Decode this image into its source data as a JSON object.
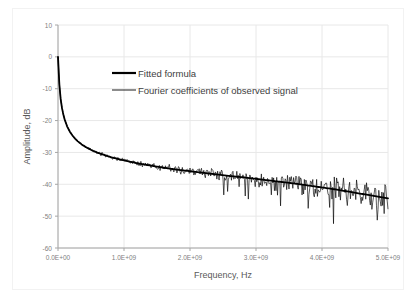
{
  "chart_data": {
    "type": "line",
    "title": "",
    "xlabel": "Frequency, Hz",
    "ylabel": "Amplitude, dB",
    "xlim": [
      0,
      5000000000
    ],
    "ylim": [
      -60,
      10
    ],
    "grid": true,
    "legend_position": "inside-top-center",
    "xticks": [
      0,
      1000000000,
      2000000000,
      3000000000,
      4000000000,
      5000000000
    ],
    "xticklabels": [
      "0.0E+00",
      "1.0E+09",
      "2.0E+09",
      "3.0E+09",
      "4.0E+09",
      "5.0E+09"
    ],
    "yticks": [
      10,
      0,
      -10,
      -20,
      -30,
      -40,
      -50,
      -60
    ],
    "yticklabels": [
      "10",
      "0",
      "-10",
      "-20",
      "-30",
      "-40",
      "-50",
      "-60"
    ],
    "colors": {
      "fitted": "#000000",
      "observed": "#000000",
      "grid": "#e8e8e8",
      "axis": "#a6a6a6",
      "text": "#808080",
      "background": "#ffffff"
    },
    "series": [
      {
        "name": "Fitted formula",
        "style": "smooth-thick",
        "x": [
          0,
          20000000,
          40000000,
          60000000,
          80000000,
          100000000,
          140000000,
          180000000,
          220000000,
          260000000,
          300000000,
          360000000,
          420000000,
          500000000,
          600000000,
          700000000,
          800000000,
          900000000,
          1000000000,
          1200000000,
          1400000000,
          1600000000,
          1800000000,
          2000000000,
          2200000000,
          2400000000,
          2600000000,
          2800000000,
          3000000000,
          3200000000,
          3400000000,
          3600000000,
          3800000000,
          4000000000,
          4200000000,
          4400000000,
          4600000000,
          4800000000,
          5000000000
        ],
        "y": [
          0.0,
          -8.5,
          -13.2,
          -16.0,
          -18.0,
          -19.6,
          -21.9,
          -23.5,
          -24.7,
          -25.7,
          -26.5,
          -27.5,
          -28.3,
          -29.2,
          -30.1,
          -30.8,
          -31.5,
          -32.0,
          -32.5,
          -33.4,
          -34.1,
          -34.8,
          -35.4,
          -35.9,
          -36.4,
          -36.9,
          -37.4,
          -37.8,
          -38.3,
          -38.8,
          -39.3,
          -39.8,
          -40.4,
          -41.0,
          -41.6,
          -42.3,
          -43.0,
          -43.7,
          -44.4
        ]
      },
      {
        "name": "Fourier coefficients of observed signal",
        "style": "noisy-thin",
        "description": "Noisy trace oscillating about the fitted curve; scatter amplitude grows with frequency, from near zero below 0.5E+09 up to roughly +/-4 dB with downward spikes to -55 dB beyond 3.0E+09"
      }
    ],
    "legend": [
      {
        "label": "Fitted formula",
        "swatch": "thick-black-line"
      },
      {
        "label": "Fourier coefficients of observed signal",
        "swatch": "thin-black-line"
      }
    ]
  }
}
